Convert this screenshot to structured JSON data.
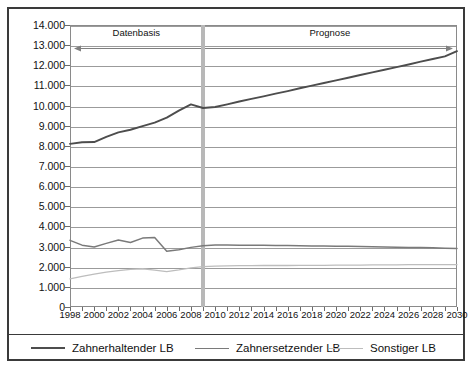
{
  "chart_data": {
    "type": "line",
    "title": "",
    "xlabel": "",
    "ylabel": "",
    "xlim": [
      1998,
      2030
    ],
    "ylim": [
      0,
      14000
    ],
    "grid": true,
    "legend_position": "bottom",
    "y_ticks": [
      "0",
      "1.000",
      "2.000",
      "3.000",
      "4.000",
      "5.000",
      "6.000",
      "7.000",
      "8.000",
      "9.000",
      "10.000",
      "11.000",
      "12.000",
      "13.000",
      "14.000"
    ],
    "y_tick_values": [
      0,
      1000,
      2000,
      3000,
      4000,
      5000,
      6000,
      7000,
      8000,
      9000,
      10000,
      11000,
      12000,
      13000,
      14000
    ],
    "x_ticks": [
      "1998",
      "2000",
      "2002",
      "2004",
      "2006",
      "2008",
      "2010",
      "2012",
      "2014",
      "2016",
      "2018",
      "2020",
      "2022",
      "2024",
      "2026",
      "2028",
      "2030"
    ],
    "x_tick_values": [
      1998,
      2000,
      2002,
      2004,
      2006,
      2008,
      2010,
      2012,
      2014,
      2016,
      2018,
      2020,
      2022,
      2024,
      2026,
      2028,
      2030
    ],
    "x": [
      1998,
      1999,
      2000,
      2001,
      2002,
      2003,
      2004,
      2005,
      2006,
      2007,
      2008,
      2009,
      2010,
      2011,
      2012,
      2013,
      2014,
      2015,
      2016,
      2017,
      2018,
      2019,
      2020,
      2021,
      2022,
      2023,
      2024,
      2025,
      2026,
      2027,
      2028,
      2029,
      2030
    ],
    "series": [
      {
        "name": "Zahnerhaltender LB",
        "color": "#4d4d4d",
        "values": [
          8100,
          8180,
          8190,
          8450,
          8670,
          8800,
          8980,
          9150,
          9400,
          9750,
          10060,
          9880,
          9930,
          10060,
          10200,
          10330,
          10460,
          10590,
          10720,
          10860,
          10990,
          11120,
          11250,
          11380,
          11520,
          11650,
          11780,
          11910,
          12040,
          12180,
          12310,
          12440,
          12700
        ]
      },
      {
        "name": "Zahnersetzender LB",
        "color": "#7a7a7a",
        "values": [
          3310,
          3070,
          2980,
          3160,
          3330,
          3200,
          3420,
          3450,
          2770,
          2840,
          2960,
          3040,
          3080,
          3080,
          3070,
          3060,
          3060,
          3050,
          3050,
          3040,
          3030,
          3030,
          3020,
          3010,
          3000,
          2990,
          2980,
          2970,
          2960,
          2950,
          2940,
          2920,
          2900
        ]
      },
      {
        "name": "Sonstiger LB",
        "color": "#bdbdbd",
        "values": [
          1400,
          1520,
          1630,
          1730,
          1810,
          1870,
          1900,
          1830,
          1760,
          1840,
          1940,
          2000,
          2030,
          2040,
          2050,
          2050,
          2060,
          2060,
          2060,
          2070,
          2070,
          2070,
          2080,
          2080,
          2080,
          2090,
          2090,
          2090,
          2100,
          2100,
          2100,
          2100,
          2100
        ]
      }
    ],
    "annotations": [
      {
        "label": "Datenbasis",
        "arrow": "left",
        "from": 1998,
        "to": 2009
      },
      {
        "label": "Prognose",
        "arrow": "right",
        "from": 2009,
        "to": 2030
      }
    ],
    "divider": {
      "value": 2009,
      "color": "#b8b8b8"
    }
  },
  "legend": {
    "items": [
      {
        "label": "Zahnerhaltender LB",
        "color": "#4d4d4d",
        "thickness": 2.2
      },
      {
        "label": "Zahnersetzender LB",
        "color": "#7a7a7a",
        "thickness": 1.8
      },
      {
        "label": "Sonstiger LB",
        "color": "#bdbdbd",
        "thickness": 1.6
      }
    ]
  },
  "colors": {
    "frame": "#3a3a3a",
    "grid": "#9b9b9b",
    "plot_border": "#8a8a8a",
    "background": "#ffffff",
    "text": "#111111"
  }
}
